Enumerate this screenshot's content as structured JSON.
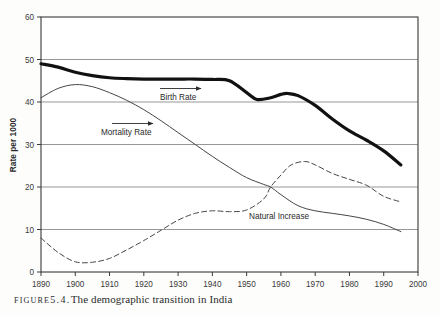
{
  "caption": {
    "label": "FIGURE",
    "number": "5.4.",
    "text": "The demographic transition in India"
  },
  "chart_data": {
    "type": "line",
    "title": "",
    "xlabel": "",
    "ylabel": "Rate per 1000",
    "xlim": [
      1890,
      2000
    ],
    "ylim": [
      0,
      60
    ],
    "xticks": [
      1890,
      1900,
      1910,
      1920,
      1930,
      1940,
      1950,
      1960,
      1970,
      1980,
      1990,
      2000
    ],
    "yticks": [
      0,
      10,
      20,
      30,
      40,
      50,
      60
    ],
    "grid": "horizontal",
    "legend_position": "inline-annotations",
    "colors": {
      "birth_rate": "#111111",
      "mortality_rate": "#3b3b3b",
      "natural_increase": "#3b3b3b",
      "grid": "#8b8b8b",
      "axis": "#3a3a3a"
    },
    "series": [
      {
        "name": "Birth Rate",
        "style": "thick-solid",
        "x": [
          1890,
          1895,
          1900,
          1905,
          1910,
          1915,
          1920,
          1925,
          1930,
          1935,
          1940,
          1945,
          1950,
          1953,
          1957,
          1960,
          1962,
          1965,
          1970,
          1975,
          1980,
          1985,
          1990,
          1995
        ],
        "values": [
          49.0,
          48.2,
          47.0,
          46.2,
          45.7,
          45.5,
          45.4,
          45.4,
          45.4,
          45.4,
          45.3,
          45.0,
          42.2,
          40.6,
          41.0,
          41.8,
          42.0,
          41.5,
          39.2,
          36.0,
          33.2,
          31.0,
          28.5,
          25.2
        ]
      },
      {
        "name": "Mortality Rate",
        "style": "thin-solid",
        "x": [
          1890,
          1895,
          1900,
          1905,
          1910,
          1915,
          1920,
          1925,
          1930,
          1935,
          1940,
          1945,
          1950,
          1955,
          1957,
          1960,
          1965,
          1970,
          1975,
          1980,
          1985,
          1990,
          1995
        ],
        "values": [
          41.0,
          43.2,
          44.1,
          43.6,
          42.2,
          40.4,
          38.2,
          35.6,
          32.8,
          30.0,
          27.2,
          24.6,
          22.2,
          20.6,
          20.0,
          18.2,
          15.6,
          14.4,
          13.8,
          13.2,
          12.4,
          11.2,
          9.5
        ]
      },
      {
        "name": "Natural Increase",
        "style": "dashed",
        "x": [
          1890,
          1895,
          1900,
          1905,
          1910,
          1915,
          1920,
          1925,
          1930,
          1935,
          1940,
          1945,
          1950,
          1955,
          1957,
          1960,
          1963,
          1967,
          1970,
          1975,
          1980,
          1985,
          1990,
          1995
        ],
        "values": [
          8.0,
          4.6,
          2.4,
          2.3,
          3.2,
          5.2,
          7.4,
          9.8,
          12.2,
          13.8,
          14.4,
          14.2,
          14.6,
          17.2,
          20.0,
          22.8,
          25.2,
          26.0,
          25.2,
          23.2,
          21.8,
          20.4,
          17.8,
          16.5
        ]
      }
    ],
    "annotations": [
      {
        "text": "Birth Rate",
        "series": "Birth Rate",
        "has_arrow": true,
        "arrow_direction": "right"
      },
      {
        "text": "Mortality Rate",
        "series": "Mortality Rate",
        "has_arrow": true,
        "arrow_direction": "right"
      },
      {
        "text": "Natural Increase",
        "series": "Natural Increase",
        "has_arrow": false
      }
    ]
  }
}
